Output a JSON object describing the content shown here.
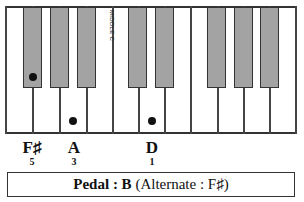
{
  "diagram": {
    "type": "piano-keyboard-chord",
    "middle_c_label": "MIDDLE C",
    "notes": [
      {
        "name": "F♯",
        "finger": "5"
      },
      {
        "name": "A",
        "finger": "3"
      },
      {
        "name": "D",
        "finger": "1"
      }
    ],
    "pedal": {
      "label": "Pedal : B",
      "alternate": "(Alternate : F♯)"
    },
    "colors": {
      "black_key": "#bbbbbb",
      "lines": "#333333",
      "dot": "#111111"
    }
  }
}
